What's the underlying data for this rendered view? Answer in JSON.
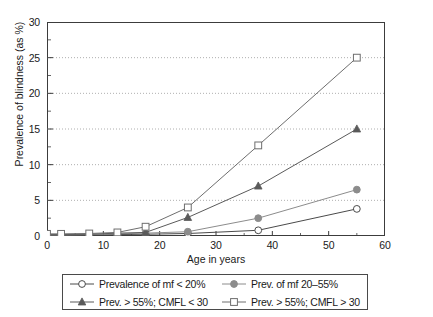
{
  "chart_data": {
    "type": "line",
    "title": "",
    "xlabel": "Age in years",
    "ylabel": "Prevalence of blindness (as %)",
    "xlim": [
      0,
      60
    ],
    "ylim": [
      0,
      30
    ],
    "x_major_ticks": [
      0,
      10,
      20,
      30,
      40,
      50,
      60
    ],
    "x_minor_ticks": [
      5,
      15,
      25,
      35,
      45,
      55
    ],
    "y_major_ticks": [
      0,
      5,
      10,
      15,
      20,
      25,
      30
    ],
    "y_minor_ticks": [
      2.5,
      7.5,
      12.5,
      17.5,
      22.5,
      27.5
    ],
    "x_tick_labels": [
      "0",
      "10",
      "20",
      "30",
      "40",
      "50",
      "60"
    ],
    "y_tick_labels": [
      "0",
      "5",
      "10",
      "15",
      "20",
      "25",
      "30"
    ],
    "grid": "horizontal-dotted",
    "legend_position": "below",
    "x": [
      0,
      2.5,
      7.5,
      12.5,
      17.5,
      25,
      37.5,
      55
    ],
    "series": [
      {
        "name": "Prevalence of mf < 20%",
        "marker": "open-circle",
        "color": "#4a4a4a",
        "values": [
          0.1,
          0.1,
          0.15,
          0.2,
          0.25,
          0.35,
          0.8,
          3.8
        ]
      },
      {
        "name": "Prev. of mf 20–55%",
        "marker": "filled-circle",
        "color": "#8c8c8c",
        "values": [
          0.15,
          0.15,
          0.2,
          0.3,
          0.4,
          0.6,
          2.5,
          6.5
        ]
      },
      {
        "name": "Prev. > 55%; CMFL < 30",
        "marker": "filled-triangle",
        "color": "#5a5a5a",
        "values": [
          0.2,
          0.2,
          0.25,
          0.4,
          0.5,
          2.6,
          7.0,
          15.0
        ]
      },
      {
        "name": "Prev. > 55%; CMFL > 30",
        "marker": "open-square",
        "color": "#6e6e6e",
        "values": [
          0.3,
          0.3,
          0.35,
          0.5,
          1.3,
          4.0,
          12.7,
          25.0
        ]
      }
    ]
  },
  "legend": {
    "items": [
      {
        "label": "Prevalence of mf < 20%"
      },
      {
        "label": "Prev. of mf 20–55%"
      },
      {
        "label": "Prev. > 55%; CMFL < 30"
      },
      {
        "label": "Prev. > 55%; CMFL > 30"
      }
    ]
  }
}
